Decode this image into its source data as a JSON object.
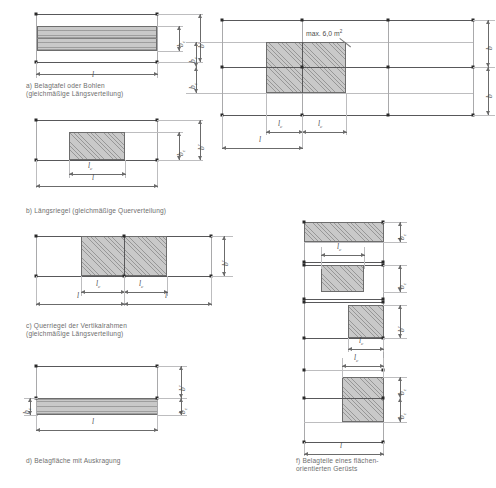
{
  "figure": {
    "kind": "technical-drawing",
    "panels": [
      {
        "id": "a",
        "caption": "a)  Belagtafel oder Bohlen\n     (gleichmäßige Längsverteilung)",
        "dimensions": [
          "b_c",
          "b'",
          "l"
        ]
      },
      {
        "id": "b",
        "caption": "b)  Längsriegel (gleichmäßige Querverteilung)",
        "dimensions": [
          "b_c",
          "b'",
          "l_c",
          "l"
        ]
      },
      {
        "id": "c",
        "caption": "c)  Querriegel der Vertikalrahmen\n     (gleichmäßige Längsverteilung)",
        "dimensions": [
          "b'",
          "l_c",
          "l_c",
          "l",
          "l"
        ]
      },
      {
        "id": "d",
        "caption": "d)  Belagfläche mit Auskragung",
        "dimensions": [
          "b'",
          "b_c",
          "l"
        ]
      },
      {
        "id": "e",
        "caption": "",
        "note": "max. 6,0 m²",
        "dimensions": [
          "b_c",
          "b_c",
          "b",
          "b",
          "l_c",
          "l_c",
          "l"
        ]
      },
      {
        "id": "f",
        "caption": "f)  Belagteile eines flächen-\n     orientierten Gerüsts",
        "dimensions": [
          "b_c",
          "b_c",
          "b'",
          "b_c",
          "b_c",
          "l_c",
          "l_c",
          "l_c",
          "l"
        ]
      }
    ],
    "labels": {
      "b": "b",
      "b_prime": "b",
      "b_c": "b",
      "l": "l",
      "l_c": "l",
      "sub_c": "c",
      "prime": "′",
      "max_area": "max. 6,0 m",
      "max_area_exp": "2"
    }
  }
}
